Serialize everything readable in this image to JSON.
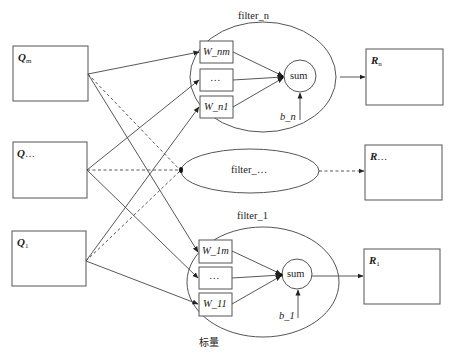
{
  "diagram": {
    "type": "neural-filter-bank",
    "inputs": [
      {
        "id": "Q_m",
        "label": "Q",
        "sub": "m"
      },
      {
        "id": "Q_dots",
        "label": "Q",
        "sub": "…"
      },
      {
        "id": "Q_1",
        "label": "Q",
        "sub": "1"
      }
    ],
    "filters": [
      {
        "id": "filter_n",
        "title": "filter_n",
        "weights": [
          "W_nm",
          "…",
          "W_n1"
        ],
        "sum_label": "sum",
        "bias": "b_n"
      },
      {
        "id": "filter_dots",
        "title": "filter_…"
      },
      {
        "id": "filter_1",
        "title": "filter_1",
        "weights": [
          "W_1m",
          "…",
          "W_11"
        ],
        "sum_label": "sum",
        "bias": "b_1"
      }
    ],
    "outputs": [
      {
        "id": "R_n",
        "label": "R",
        "sub": "n"
      },
      {
        "id": "R_dots",
        "label": "R",
        "sub": "…"
      },
      {
        "id": "R_1",
        "label": "R",
        "sub": "1"
      }
    ],
    "caption": "标量",
    "colors": {
      "stroke": "#444444",
      "background": "#ffffff",
      "text": "#222222"
    }
  }
}
